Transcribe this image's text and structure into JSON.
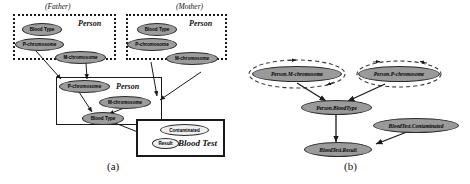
{
  "figure": {
    "panel_a_label": "(a)",
    "panel_b_label": "(b)"
  },
  "panel_a": {
    "father_box": {
      "role_label": "(Father)",
      "class_label": "Person",
      "nodes": [
        {
          "name": "blood-type",
          "label": "Blood Type"
        },
        {
          "name": "p-chromosome",
          "label": "P-chromosome"
        },
        {
          "name": "m-chromosome",
          "label": "M-chromosome"
        }
      ]
    },
    "mother_box": {
      "role_label": "(Mother)",
      "class_label": "Person",
      "nodes": [
        {
          "name": "blood-type",
          "label": "Blood Type"
        },
        {
          "name": "p-chromosome",
          "label": "P-chromosome"
        },
        {
          "name": "m-chromosome",
          "label": "M-chromosome"
        }
      ]
    },
    "child_box": {
      "class_label": "Person",
      "nodes": [
        {
          "name": "p-chromosome",
          "label": "P-chromosome"
        },
        {
          "name": "m-chromosome",
          "label": "M-chromosome"
        },
        {
          "name": "blood-type",
          "label": "Blood Type"
        }
      ]
    },
    "blood_test_box": {
      "class_label": "Blood Test",
      "nodes": [
        {
          "name": "contaminated",
          "label": "Contaminated"
        },
        {
          "name": "result",
          "label": "Result"
        }
      ]
    }
  },
  "panel_b": {
    "nodes": [
      {
        "name": "person-m-chromosome",
        "label": "Person.M-chromosome",
        "self_loop": true
      },
      {
        "name": "person-p-chromosome",
        "label": "Person.P-chromosome",
        "self_loop": true
      },
      {
        "name": "person-bloodtype",
        "label": "Person.BloodType",
        "self_loop": false
      },
      {
        "name": "bloodtest-contaminated",
        "label": "BloodTest.Contaminated",
        "self_loop": false
      },
      {
        "name": "bloodtest-result",
        "label": "BloodTest.Result",
        "self_loop": false
      }
    ],
    "edges": [
      {
        "from": "person-m-chromosome",
        "to": "person-bloodtype"
      },
      {
        "from": "person-p-chromosome",
        "to": "person-bloodtype"
      },
      {
        "from": "person-bloodtype",
        "to": "bloodtest-result"
      },
      {
        "from": "bloodtest-contaminated",
        "to": "bloodtest-result"
      }
    ]
  },
  "colors": {
    "node_fill_gray": "#9c9c9c",
    "node_fill_light": "#efefef",
    "stroke": "#1a1a1a",
    "background": "#ffffff"
  }
}
